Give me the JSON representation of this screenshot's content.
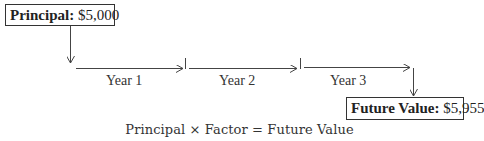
{
  "principal": {
    "label": "Principal:",
    "value": "$5,000"
  },
  "timeline": {
    "periods": [
      {
        "label": "Year 1"
      },
      {
        "label": "Year 2"
      },
      {
        "label": "Year 3"
      }
    ]
  },
  "future_value": {
    "label": "Future Value:",
    "value": "$5,955"
  },
  "formula": {
    "text": "Principal × Factor = Future Value"
  }
}
